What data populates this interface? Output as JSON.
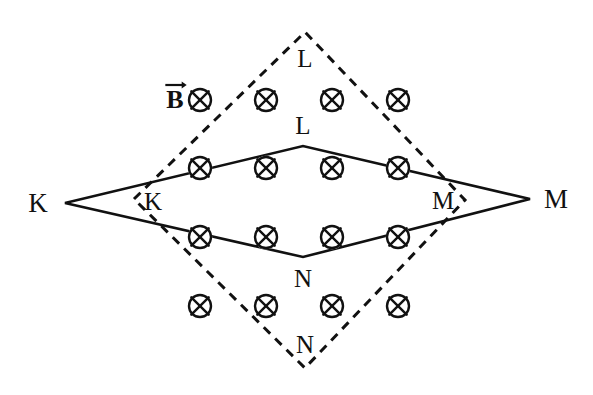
{
  "figure": {
    "background_color": "#ffffff",
    "stroke_color": "#111111",
    "width": 593,
    "height": 395
  },
  "field": {
    "symbol_name": "field-into-page-icon",
    "label_text": "B",
    "label_accent": "vector-arrow",
    "direction": "into-page",
    "label_position": {
      "x": 175,
      "y": 100
    },
    "grid": {
      "columns_x": [
        200,
        266,
        332,
        398
      ],
      "rows_y": [
        100,
        168,
        237,
        306
      ],
      "radius": 11,
      "count": 16
    }
  },
  "shapes": {
    "solid_rhombus": {
      "name": "solid-rhombus-KLMN",
      "line_style": "solid",
      "stroke_width": 2.6,
      "vertices": [
        {
          "label": "K",
          "x": 65,
          "y": 203
        },
        {
          "label": "L",
          "x": 303,
          "y": 146
        },
        {
          "label": "M",
          "x": 530,
          "y": 199
        },
        {
          "label": "N",
          "x": 303,
          "y": 257
        }
      ]
    },
    "dashed_rhombus": {
      "name": "dashed-rhombus-KLMN",
      "line_style": "dashed",
      "stroke_width": 3.0,
      "dash_pattern": "9 7",
      "vertices": [
        {
          "label": "K",
          "x": 134,
          "y": 199
        },
        {
          "label": "L",
          "x": 305,
          "y": 32
        },
        {
          "label": "M",
          "x": 465,
          "y": 200
        },
        {
          "label": "N",
          "x": 305,
          "y": 368
        }
      ]
    }
  },
  "labels": [
    {
      "name": "label-K-outer",
      "text": "K",
      "x": 38,
      "y": 203,
      "size": "large"
    },
    {
      "name": "label-M-outer",
      "text": "M",
      "x": 556,
      "y": 199,
      "size": "large"
    },
    {
      "name": "label-L-dashed",
      "text": "L",
      "x": 305,
      "y": 58,
      "size": "small"
    },
    {
      "name": "label-L-solid",
      "text": "L",
      "x": 303,
      "y": 125,
      "size": "small"
    },
    {
      "name": "label-K-dashed",
      "text": "K",
      "x": 153,
      "y": 201,
      "size": "small"
    },
    {
      "name": "label-M-dashed",
      "text": "M",
      "x": 443,
      "y": 200,
      "size": "small"
    },
    {
      "name": "label-N-solid",
      "text": "N",
      "x": 303,
      "y": 278,
      "size": "small"
    },
    {
      "name": "label-N-dashed",
      "text": "N",
      "x": 305,
      "y": 344,
      "size": "small"
    }
  ]
}
